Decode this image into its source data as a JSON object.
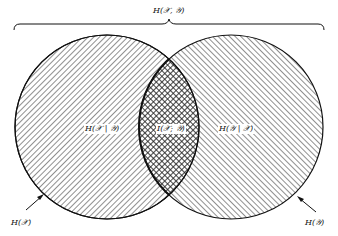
{
  "diagram": {
    "total_label": "H(𝒳, 𝒴)",
    "left_region_label": "H(𝒳 | 𝒴)",
    "intersection_label": "I(𝒳; 𝒴)",
    "right_region_label": "H(𝒴 | 𝒳)",
    "left_circle_label": "H(𝒳)",
    "right_circle_label": "H(𝒴)",
    "colors": {
      "stroke": "#111111",
      "background": "#ffffff"
    }
  }
}
